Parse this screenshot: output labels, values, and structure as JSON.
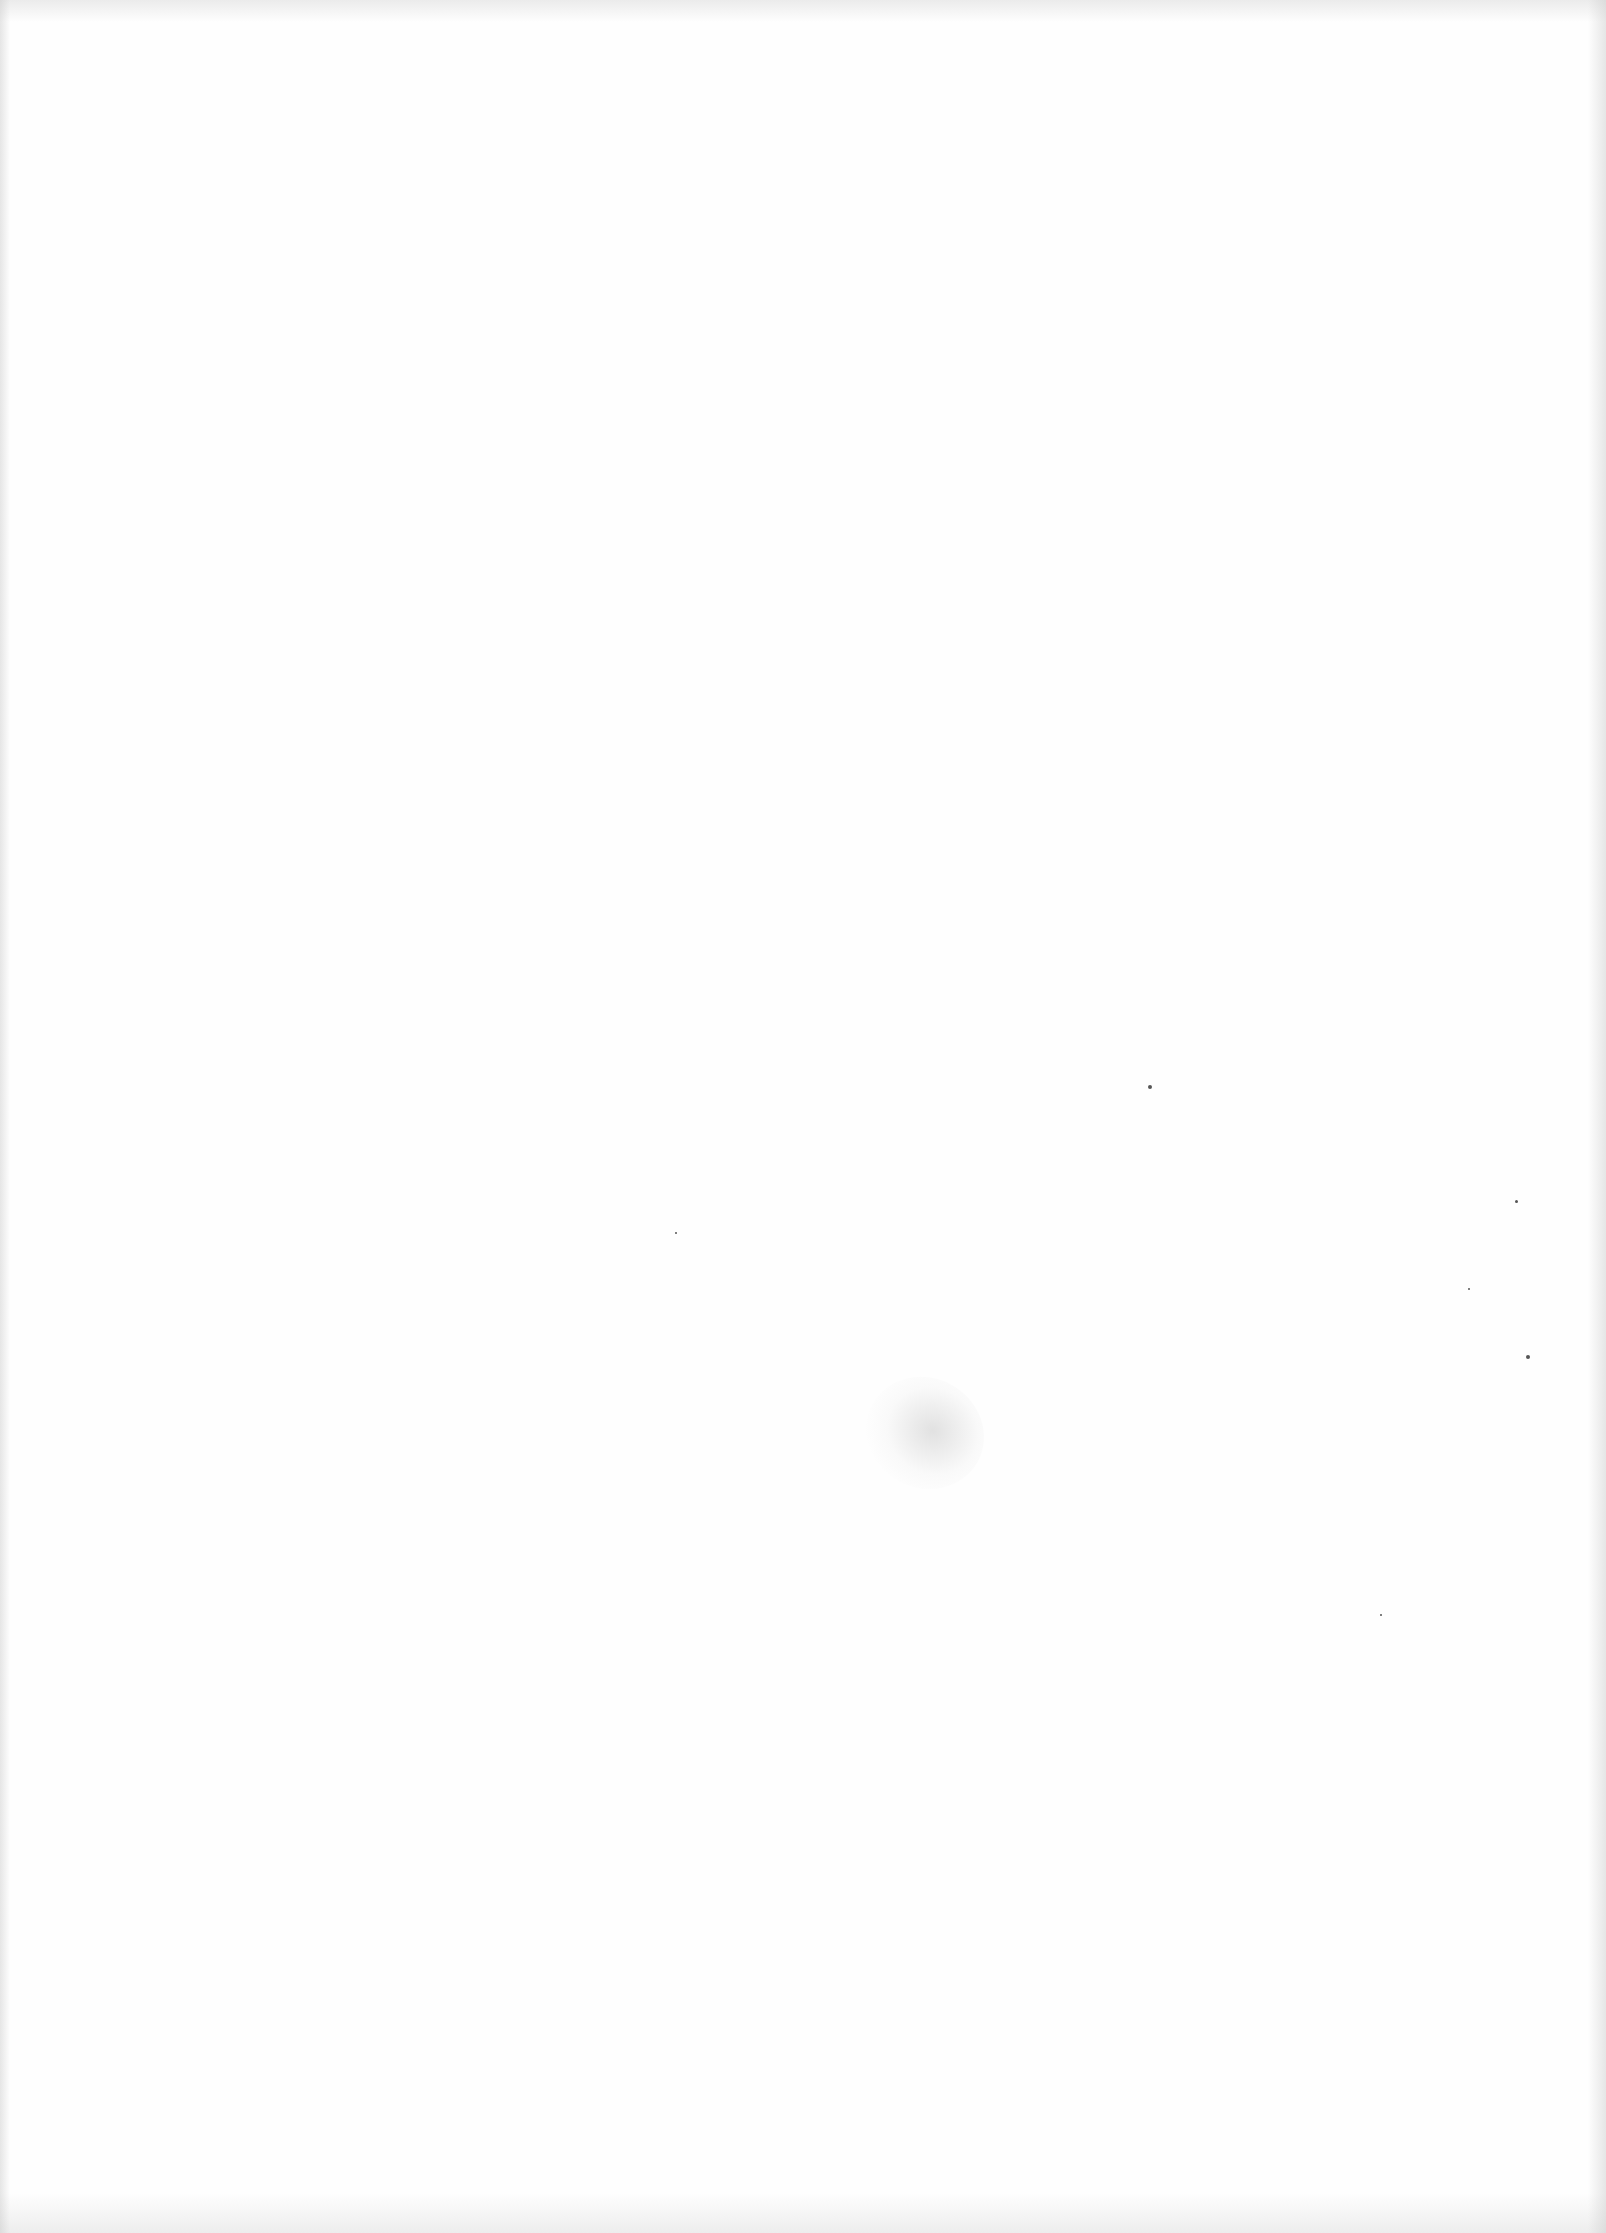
{
  "page": {
    "type": "blank-scanned-page",
    "text": ""
  },
  "marks": {
    "smudge": {
      "x": 865,
      "y": 1378
    },
    "specks": [
      {
        "x": 1148,
        "y": 1085,
        "size": 4
      },
      {
        "x": 1515,
        "y": 1200,
        "size": 3
      },
      {
        "x": 1468,
        "y": 1288,
        "size": 2
      },
      {
        "x": 1526,
        "y": 1355,
        "size": 4
      },
      {
        "x": 1380,
        "y": 1614,
        "size": 2
      },
      {
        "x": 675,
        "y": 1232,
        "size": 2
      }
    ]
  }
}
